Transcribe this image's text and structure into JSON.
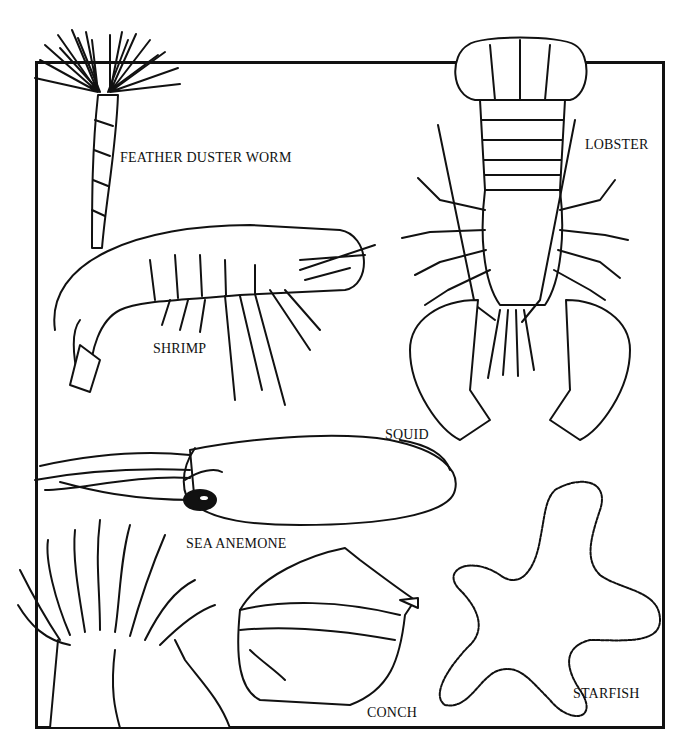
{
  "figure": {
    "type": "line-art illustration",
    "frame": {
      "border_color": "#111111",
      "background": "#ffffff"
    },
    "labels": [
      {
        "id": "feather_duster_worm",
        "text": "FEATHER DUSTER WORM"
      },
      {
        "id": "lobster",
        "text": "LOBSTER"
      },
      {
        "id": "shrimp",
        "text": "SHRIMP"
      },
      {
        "id": "squid",
        "text": "SQUID"
      },
      {
        "id": "sea_anemone",
        "text": "SEA ANEMONE"
      },
      {
        "id": "conch",
        "text": "CONCH"
      },
      {
        "id": "starfish",
        "text": "STARFISH"
      }
    ]
  }
}
